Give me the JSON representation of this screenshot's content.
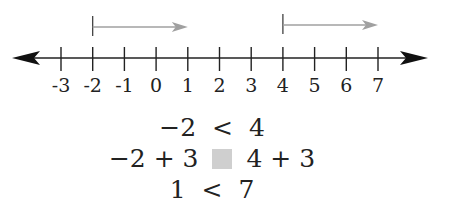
{
  "number_line": {
    "min": -3,
    "max": 7,
    "tick_labels": [
      "-3",
      "-2",
      "-1",
      "0",
      "1",
      "2",
      "3",
      "4",
      "5",
      "6",
      "7"
    ],
    "arrows_both_ends": true,
    "axis_color": "#222222",
    "shift_arrow_color": "#a0a0a0",
    "shift_arrows": [
      {
        "from": -2,
        "to": 1,
        "label": "shift of -2 by +3"
      },
      {
        "from": 4,
        "to": 7,
        "label": "shift of 4 by +3"
      }
    ]
  },
  "equations": {
    "line1": {
      "left": "−2",
      "op": "<",
      "right": "4"
    },
    "line2": {
      "left": "−2 + 3",
      "op_placeholder": "box",
      "right": "4 + 3",
      "box_color": "#cfcfcf"
    },
    "line3": {
      "left": "1",
      "op": "<",
      "right": "7"
    }
  }
}
